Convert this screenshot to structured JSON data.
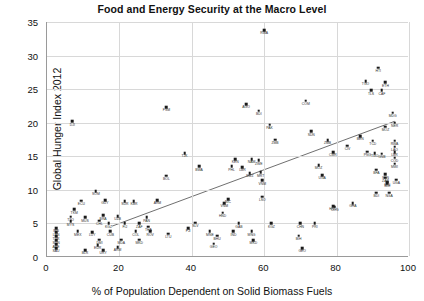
{
  "chart_data": {
    "type": "scatter",
    "title": "Food and Energy Security at the Macro Level",
    "xlabel": "% of Population Dependent on Solid Biomass Fuels",
    "ylabel": "Global Hunger Index 2012",
    "xlim": [
      0,
      100
    ],
    "ylim": [
      0,
      35
    ],
    "xticks": [
      0,
      20,
      40,
      60,
      80,
      100
    ],
    "yticks": [
      0,
      5,
      10,
      15,
      20,
      25,
      30,
      35
    ],
    "grid": true,
    "legend": "none",
    "trendline": {
      "x0": 18,
      "y0": 4.6,
      "x1": 96,
      "y1": 20.2,
      "style": "solid-thin"
    },
    "points": [
      {
        "label": "DJI",
        "x": 7,
        "y": 20.2
      },
      {
        "label": "SOM",
        "x": 13.5,
        "y": 9.8
      },
      {
        "label": "ECU",
        "x": 9.5,
        "y": 8.4
      },
      {
        "label": "GUY",
        "x": 16,
        "y": 8.5
      },
      {
        "label": "SUR",
        "x": 21.5,
        "y": 8.3
      },
      {
        "label": "ARM",
        "x": 30.5,
        "y": 8.5
      },
      {
        "label": "TKM",
        "x": 7.5,
        "y": 7.1
      },
      {
        "label": "TTO",
        "x": 6.5,
        "y": 6.0
      },
      {
        "label": "MYS",
        "x": 6.5,
        "y": 5.3
      },
      {
        "label": "MUS",
        "x": 10.5,
        "y": 5.9
      },
      {
        "label": "BRA",
        "x": 15.5,
        "y": 6.2
      },
      {
        "label": "CHL",
        "x": 14.5,
        "y": 5.4
      },
      {
        "label": "UZB",
        "x": 19.5,
        "y": 6.1
      },
      {
        "label": "PAN",
        "x": 27.5,
        "y": 5.9
      },
      {
        "label": "KGZ",
        "x": 17,
        "y": 5.0
      },
      {
        "label": "FIJ",
        "x": 21.5,
        "y": 5.0
      },
      {
        "label": "ZAF",
        "x": 25.5,
        "y": 5.0
      },
      {
        "label": "SLV",
        "x": 41,
        "y": 5.1
      },
      {
        "label": "IRN",
        "x": 2.5,
        "y": 4.3
      },
      {
        "label": "LBN",
        "x": 2.5,
        "y": 3.7
      },
      {
        "label": "TUR",
        "x": 2.5,
        "y": 3.1
      },
      {
        "label": "SUN",
        "x": 2.5,
        "y": 2.5
      },
      {
        "label": "ARE",
        "x": 2.5,
        "y": 1.9
      },
      {
        "label": "SAU",
        "x": 2.5,
        "y": 1.3
      },
      {
        "label": "MEX",
        "x": 8.5,
        "y": 3.8
      },
      {
        "label": "LUY",
        "x": 12.5,
        "y": 3.7
      },
      {
        "label": "CUB",
        "x": 17.5,
        "y": 3.8
      },
      {
        "label": "COL",
        "x": 24.5,
        "y": 3.8
      },
      {
        "label": "ROV",
        "x": 28.5,
        "y": 3.8
      },
      {
        "label": "LTU",
        "x": 33.5,
        "y": 3.5
      },
      {
        "label": "DMI",
        "x": 14.5,
        "y": 2.6
      },
      {
        "label": "MDA",
        "x": 20.5,
        "y": 2.6
      },
      {
        "label": "MKD",
        "x": 25.5,
        "y": 2.6
      },
      {
        "label": "EUR",
        "x": 14,
        "y": 1.8
      },
      {
        "label": "ARM2",
        "x": 19.5,
        "y": 1.5
      },
      {
        "label": "BLR",
        "x": 10.5,
        "y": 1.0
      },
      {
        "label": "URY",
        "x": 15.5,
        "y": 1.0
      },
      {
        "label": "KBR",
        "x": 24,
        "y": 8.3
      },
      {
        "label": "THA",
        "x": 28,
        "y": 4.5
      },
      {
        "label": "BOL",
        "x": 33,
        "y": 12.1
      },
      {
        "label": "TJK",
        "x": 38,
        "y": 15.5
      },
      {
        "label": "BWA",
        "x": 42,
        "y": 13.5
      },
      {
        "label": "FSM",
        "x": 33,
        "y": 22.3
      },
      {
        "label": "FJI",
        "x": 39,
        "y": 4.3
      },
      {
        "label": "MNE",
        "x": 45,
        "y": 3.8
      },
      {
        "label": "GEO",
        "x": 46,
        "y": 2.0
      },
      {
        "label": "BHU",
        "x": 47,
        "y": 3.2
      },
      {
        "label": "VNM",
        "x": 49,
        "y": 8.0
      },
      {
        "label": "HND",
        "x": 48.5,
        "y": 6.6
      },
      {
        "label": "NIC",
        "x": 50,
        "y": 8.6
      },
      {
        "label": "KEN",
        "x": 52,
        "y": 14.6
      },
      {
        "label": "PHL",
        "x": 51,
        "y": 13.5
      },
      {
        "label": "LBR",
        "x": 54,
        "y": 13.4
      },
      {
        "label": "NAM",
        "x": 56.5,
        "y": 14.6
      },
      {
        "label": "ZWE",
        "x": 58.5,
        "y": 14.4
      },
      {
        "label": "MRT",
        "x": 59,
        "y": 12.6
      },
      {
        "label": "SWZ",
        "x": 56,
        "y": 12.5
      },
      {
        "label": "VNM2",
        "x": 59.5,
        "y": 11.4
      },
      {
        "label": "LSO",
        "x": 59.5,
        "y": 9.0
      },
      {
        "label": "GAB",
        "x": 53,
        "y": 5.0
      },
      {
        "label": "IND",
        "x": 51.5,
        "y": 3.8
      },
      {
        "label": "MNG",
        "x": 56.5,
        "y": 3.8
      },
      {
        "label": "MKD2",
        "x": 57,
        "y": 2.5
      },
      {
        "label": "AGO",
        "x": 55,
        "y": 22.8
      },
      {
        "label": "BDI",
        "x": 58.5,
        "y": 21.8
      },
      {
        "label": "RWA",
        "x": 60,
        "y": 33.8
      },
      {
        "label": "PAK",
        "x": 61.5,
        "y": 19.7
      },
      {
        "label": "ZMB",
        "x": 63,
        "y": 17.5
      },
      {
        "label": "KGZ2",
        "x": 62,
        "y": 5.0
      },
      {
        "label": "CHN",
        "x": 70,
        "y": 5.0
      },
      {
        "label": "PRI",
        "x": 74,
        "y": 5.0
      },
      {
        "label": "BIH",
        "x": 69.5,
        "y": 3.2
      },
      {
        "label": "GEO2",
        "x": 70.5,
        "y": 1.3
      },
      {
        "label": "HND2",
        "x": 79,
        "y": 7.6
      },
      {
        "label": "COG",
        "x": 79.5,
        "y": 7.5
      },
      {
        "label": "UGA",
        "x": 76,
        "y": 12.2
      },
      {
        "label": "MOZ",
        "x": 75,
        "y": 13.7
      },
      {
        "label": "CMR",
        "x": 79,
        "y": 15.6
      },
      {
        "label": "CIV",
        "x": 83,
        "y": 16.6
      },
      {
        "label": "SDN",
        "x": 73,
        "y": 18.7
      },
      {
        "label": "COM",
        "x": 71.5,
        "y": 23.3
      },
      {
        "label": "ZMB2",
        "x": 77.5,
        "y": 17.4
      },
      {
        "label": "GHA",
        "x": 84.5,
        "y": 8.0
      },
      {
        "label": "BEN",
        "x": 86.5,
        "y": 18.0
      },
      {
        "label": "TGO",
        "x": 88,
        "y": 26.2
      },
      {
        "label": "HTI",
        "x": 91.5,
        "y": 28.2
      },
      {
        "label": "TLS",
        "x": 89.5,
        "y": 24.8
      },
      {
        "label": "CAF",
        "x": 92.5,
        "y": 24.8
      },
      {
        "label": "ETH",
        "x": 93.5,
        "y": 26.0
      },
      {
        "label": "MDG",
        "x": 95.5,
        "y": 21.5
      },
      {
        "label": "NER",
        "x": 96,
        "y": 20.0
      },
      {
        "label": "MOZ2",
        "x": 93.5,
        "y": 19.4
      },
      {
        "label": "TCD",
        "x": 90,
        "y": 17.3
      },
      {
        "label": "RWA2",
        "x": 96,
        "y": 17.3
      },
      {
        "label": "LAO",
        "x": 96,
        "y": 16.4
      },
      {
        "label": "LBR2",
        "x": 96,
        "y": 15.6
      },
      {
        "label": "GNB",
        "x": 92.5,
        "y": 15.4
      },
      {
        "label": "COD",
        "x": 96,
        "y": 14.8
      },
      {
        "label": "MWI",
        "x": 96,
        "y": 13.9
      },
      {
        "label": "PNG",
        "x": 88.5,
        "y": 15.7
      },
      {
        "label": "TGO2",
        "x": 90.5,
        "y": 15.5
      },
      {
        "label": "BFA",
        "x": 91,
        "y": 13.0
      },
      {
        "label": "MLI",
        "x": 94,
        "y": 11.2
      },
      {
        "label": "UGA2",
        "x": 96.5,
        "y": 11.5
      },
      {
        "label": "BDI2",
        "x": 91,
        "y": 9.6
      },
      {
        "label": "NGA",
        "x": 94.5,
        "y": 9.6
      },
      {
        "label": "SEN",
        "x": 93.5,
        "y": 12.3
      },
      {
        "label": "ZAR",
        "x": 93.5,
        "y": 11.8
      },
      {
        "label": "SLE",
        "x": 94,
        "y": 11.0
      }
    ]
  }
}
